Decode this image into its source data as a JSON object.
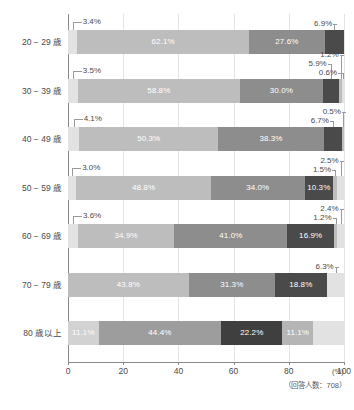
{
  "chart_data": {
    "type": "bar",
    "orientation": "horizontal",
    "stacked": true,
    "stack_mode": "percent",
    "title": "",
    "subtitle": "",
    "xlabel": "",
    "ylabel": "",
    "xlim": [
      0,
      100
    ],
    "x_unit": "(%)",
    "x_ticks": [
      "0",
      "20",
      "40",
      "60",
      "80",
      "100"
    ],
    "x_tick_values": [
      0,
      20,
      40,
      60,
      80,
      100
    ],
    "grid": true,
    "grid_axis": "x",
    "legend": "none",
    "legend_position": "none",
    "footnote": "（回答人数：708）",
    "categories": [
      "20 − 29 歳",
      "30 − 39 歳",
      "40 − 49 歳",
      "50 − 59 歳",
      "60 − 69 歳",
      "70 − 79 歳",
      "80 歳以上"
    ],
    "series": [
      {
        "name": "seg1",
        "color": "#e2e2e2",
        "values": [
          3.4,
          3.5,
          4.1,
          3.0,
          3.6,
          0.0,
          11.1
        ]
      },
      {
        "name": "seg2",
        "color": "#bdbdbd",
        "values": [
          62.1,
          58.8,
          50.3,
          48.8,
          34.9,
          43.8,
          44.4
        ]
      },
      {
        "name": "seg3",
        "color": "#8d8d8d",
        "values": [
          27.6,
          30.0,
          38.3,
          34.0,
          41.0,
          31.3,
          0.0
        ]
      },
      {
        "name": "seg4",
        "color": "#4a4a4a",
        "values": [
          6.9,
          5.9,
          6.7,
          10.3,
          16.9,
          18.8,
          22.2
        ]
      },
      {
        "name": "seg5",
        "color": "#bdbdbd",
        "values": [
          0.0,
          1.2,
          0.5,
          1.5,
          1.2,
          6.3,
          11.1
        ]
      },
      {
        "name": "seg6",
        "color": "#e2e2e2",
        "values": [
          0.0,
          0.6,
          0.0,
          2.5,
          2.4,
          0.0,
          11.1
        ]
      }
    ],
    "rows": [
      {
        "category": "20 − 29 歳",
        "segments": [
          {
            "label": "3.4%",
            "value": 3.4,
            "color": "#e2e2e2",
            "inside": false
          },
          {
            "label": "62.1%",
            "value": 62.1,
            "color": "#bdbdbd",
            "inside": true
          },
          {
            "label": "27.6%",
            "value": 27.6,
            "color": "#8d8d8d",
            "inside": true
          },
          {
            "label": "6.9%",
            "value": 6.9,
            "color": "#4a4a4a",
            "inside": false
          }
        ],
        "callouts_left": [
          "3.4%"
        ],
        "callouts_right": [
          "6.9%"
        ]
      },
      {
        "category": "30 − 39 歳",
        "segments": [
          {
            "label": "3.5%",
            "value": 3.5,
            "color": "#e2e2e2",
            "inside": false
          },
          {
            "label": "58.8%",
            "value": 58.8,
            "color": "#bdbdbd",
            "inside": true
          },
          {
            "label": "30.0%",
            "value": 30.0,
            "color": "#8d8d8d",
            "inside": true
          },
          {
            "label": "5.9%",
            "value": 5.9,
            "color": "#4a4a4a",
            "inside": false
          },
          {
            "label": "1.2%",
            "value": 1.2,
            "color": "#bdbdbd",
            "inside": false
          },
          {
            "label": "0.6%",
            "value": 0.6,
            "color": "#e2e2e2",
            "inside": false
          }
        ],
        "callouts_left": [
          "3.5%"
        ],
        "callouts_right": [
          "1.2%",
          "5.9%",
          "0.6%"
        ]
      },
      {
        "category": "40 − 49 歳",
        "segments": [
          {
            "label": "4.1%",
            "value": 4.1,
            "color": "#e2e2e2",
            "inside": false
          },
          {
            "label": "50.3%",
            "value": 50.3,
            "color": "#bdbdbd",
            "inside": true
          },
          {
            "label": "38.3%",
            "value": 38.3,
            "color": "#8d8d8d",
            "inside": true
          },
          {
            "label": "6.7%",
            "value": 6.7,
            "color": "#4a4a4a",
            "inside": false
          },
          {
            "label": "0.5%",
            "value": 0.5,
            "color": "#bdbdbd",
            "inside": false
          }
        ],
        "callouts_left": [
          "4.1%"
        ],
        "callouts_right": [
          "0.5%",
          "6.7%"
        ]
      },
      {
        "category": "50 − 59 歳",
        "segments": [
          {
            "label": "3.0%",
            "value": 3.0,
            "color": "#e2e2e2",
            "inside": false
          },
          {
            "label": "48.8%",
            "value": 48.8,
            "color": "#bdbdbd",
            "inside": true
          },
          {
            "label": "34.0%",
            "value": 34.0,
            "color": "#8d8d8d",
            "inside": true
          },
          {
            "label": "10.3%",
            "value": 10.3,
            "color": "#4a4a4a",
            "inside": true
          },
          {
            "label": "1.5%",
            "value": 1.5,
            "color": "#bdbdbd",
            "inside": false
          },
          {
            "label": "2.5%",
            "value": 2.5,
            "color": "#e2e2e2",
            "inside": false
          }
        ],
        "callouts_left": [
          "3.0%"
        ],
        "callouts_right": [
          "2.5%",
          "1.5%"
        ]
      },
      {
        "category": "60 − 69 歳",
        "segments": [
          {
            "label": "3.6%",
            "value": 3.6,
            "color": "#e2e2e2",
            "inside": false
          },
          {
            "label": "34.9%",
            "value": 34.9,
            "color": "#bdbdbd",
            "inside": true
          },
          {
            "label": "41.0%",
            "value": 41.0,
            "color": "#8d8d8d",
            "inside": true
          },
          {
            "label": "16.9%",
            "value": 16.9,
            "color": "#4a4a4a",
            "inside": true
          },
          {
            "label": "1.2%",
            "value": 1.2,
            "color": "#bdbdbd",
            "inside": false
          },
          {
            "label": "2.4%",
            "value": 2.4,
            "color": "#e2e2e2",
            "inside": false
          }
        ],
        "callouts_left": [
          "3.6%"
        ],
        "callouts_right": [
          "2.4%",
          "1.2%"
        ]
      },
      {
        "category": "70 − 79 歳",
        "segments": [
          {
            "label": "43.8%",
            "value": 43.8,
            "color": "#bdbdbd",
            "inside": true
          },
          {
            "label": "31.3%",
            "value": 31.3,
            "color": "#8d8d8d",
            "inside": true
          },
          {
            "label": "18.8%",
            "value": 18.8,
            "color": "#4a4a4a",
            "inside": true
          },
          {
            "label": "6.3%",
            "value": 6.3,
            "color": "#e2e2e2",
            "inside": false
          }
        ],
        "callouts_left": [],
        "callouts_right": [
          "6.3%"
        ]
      },
      {
        "category": "80 歳以上",
        "segments": [
          {
            "label": "11.1%",
            "value": 11.1,
            "color": "#d2d2d2",
            "inside": true
          },
          {
            "label": "44.4%",
            "value": 44.4,
            "color": "#9d9d9d",
            "inside": true
          },
          {
            "label": "22.2%",
            "value": 22.2,
            "color": "#3f3f3f",
            "inside": true
          },
          {
            "label": "11.1%",
            "value": 11.1,
            "color": "#b5b5b5",
            "inside": true
          },
          {
            "label": "11.1%",
            "value": 11.1,
            "color": "#e2e2e2",
            "inside": false
          }
        ],
        "callouts_left": [],
        "callouts_right": []
      }
    ]
  },
  "axis": {
    "x_unit": "(%)",
    "ticks": [
      "0",
      "20",
      "40",
      "60",
      "80",
      "100"
    ]
  },
  "footer": {
    "respondents_note": "（回答人数：708）"
  },
  "colors": {
    "seg1": "#e2e2e2",
    "seg2": "#bdbdbd",
    "seg3": "#8d8d8d",
    "seg4": "#4a4a4a",
    "grid": "#e3e3e3",
    "axis": "#8a8a8a",
    "text": "#4a4a4a"
  }
}
